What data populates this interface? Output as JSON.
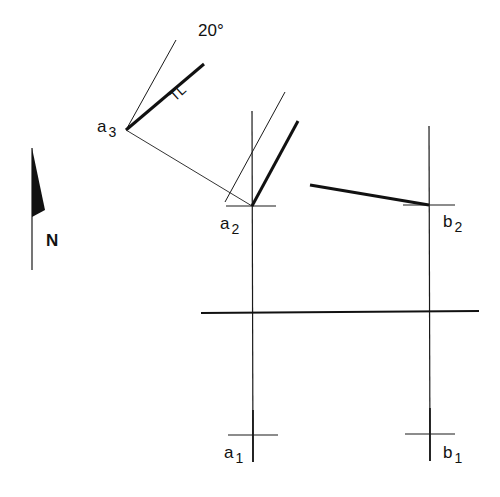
{
  "diagram": {
    "angle_label": "20°",
    "true_length_label": "TL",
    "north_label": "N",
    "points": {
      "a3": {
        "base": "a",
        "sub": "3"
      },
      "a2": {
        "base": "a",
        "sub": "2"
      },
      "b2": {
        "base": "b",
        "sub": "2"
      },
      "a1": {
        "base": "a",
        "sub": "1"
      },
      "b1": {
        "base": "b",
        "sub": "1"
      }
    },
    "colors": {
      "line": "#1a1a1a",
      "background": "#ffffff"
    }
  }
}
